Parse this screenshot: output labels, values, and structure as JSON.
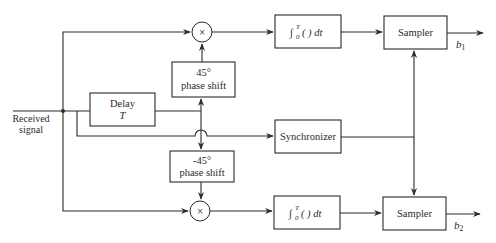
{
  "diagram": {
    "input": {
      "label_line1": "Received",
      "label_line2": "signal"
    },
    "blocks": {
      "delay": {
        "line1": "Delay",
        "line2": "T"
      },
      "phase_pos": {
        "line1": "45°",
        "line2": "phase shift"
      },
      "phase_neg": {
        "line1": "-45°",
        "line2": "phase shift"
      },
      "integrator_top": {
        "integral": "∫",
        "lower": "0",
        "upper": "T",
        "body": "(   ) dt"
      },
      "integrator_bottom": {
        "integral": "∫",
        "lower": "0",
        "upper": "T",
        "body": "(   ) dt"
      },
      "synchronizer": {
        "label": "Synchronizer"
      },
      "sampler_top": {
        "label": "Sampler"
      },
      "sampler_bottom": {
        "label": "Sampler"
      },
      "multiplier_top": {
        "symbol": "×"
      },
      "multiplier_bottom": {
        "symbol": "×"
      }
    },
    "outputs": {
      "top": {
        "base": "b",
        "sub": "1"
      },
      "bottom": {
        "base": "b",
        "sub": "2"
      }
    },
    "colors": {
      "line": "#2a2a2a",
      "background": "#ffffff"
    }
  }
}
